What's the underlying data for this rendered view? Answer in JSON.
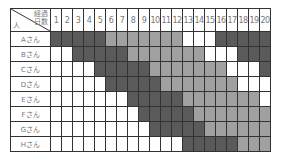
{
  "header": {
    "corner_top": "経過\n日数",
    "corner_bottom": "人",
    "days": [
      "1",
      "2",
      "3",
      "4",
      "5",
      "6",
      "7",
      "8",
      "9",
      "10",
      "11",
      "12",
      "13",
      "14",
      "15",
      "16",
      "17",
      "18",
      "19",
      "20"
    ]
  },
  "legend_colors": {
    "dark": "#5a5a5a",
    "light": "#a0a0a0",
    "empty": "#ffffff"
  },
  "rows": [
    {
      "name": "Aさん",
      "cells": [
        "d",
        "d",
        "d",
        "d",
        "d",
        "l",
        "l",
        "l",
        "l",
        "l",
        "l",
        "l",
        "w",
        "w",
        "w",
        "d",
        "d",
        "d",
        "d",
        "d"
      ]
    },
    {
      "name": "Bさん",
      "cells": [
        "w",
        "w",
        "d",
        "d",
        "d",
        "d",
        "d",
        "l",
        "l",
        "l",
        "l",
        "l",
        "l",
        "l",
        "w",
        "w",
        "w",
        "d",
        "d",
        "d"
      ]
    },
    {
      "name": "Cさん",
      "cells": [
        "w",
        "w",
        "w",
        "w",
        "d",
        "d",
        "d",
        "d",
        "d",
        "l",
        "l",
        "l",
        "l",
        "l",
        "l",
        "l",
        "w",
        "w",
        "w",
        "d"
      ]
    },
    {
      "name": "Dさん",
      "cells": [
        "w",
        "w",
        "w",
        "w",
        "w",
        "d",
        "d",
        "d",
        "d",
        "d",
        "l",
        "l",
        "l",
        "l",
        "l",
        "l",
        "l",
        "w",
        "w",
        "w"
      ]
    },
    {
      "name": "Eさん",
      "cells": [
        "w",
        "w",
        "w",
        "w",
        "w",
        "w",
        "w",
        "d",
        "d",
        "d",
        "d",
        "d",
        "l",
        "l",
        "l",
        "l",
        "l",
        "l",
        "l",
        "w"
      ]
    },
    {
      "name": "Fさん",
      "cells": [
        "w",
        "w",
        "w",
        "w",
        "w",
        "w",
        "w",
        "w",
        "d",
        "d",
        "d",
        "d",
        "d",
        "l",
        "l",
        "l",
        "l",
        "l",
        "l",
        "l"
      ]
    },
    {
      "name": "Gさん",
      "cells": [
        "w",
        "w",
        "w",
        "w",
        "w",
        "w",
        "w",
        "w",
        "w",
        "d",
        "d",
        "d",
        "d",
        "d",
        "l",
        "l",
        "l",
        "l",
        "l",
        "l"
      ]
    },
    {
      "name": "Hさん",
      "cells": [
        "w",
        "w",
        "w",
        "w",
        "w",
        "w",
        "w",
        "w",
        "w",
        "w",
        "w",
        "w",
        "d",
        "d",
        "d",
        "d",
        "d",
        "l",
        "l",
        "l"
      ]
    }
  ]
}
